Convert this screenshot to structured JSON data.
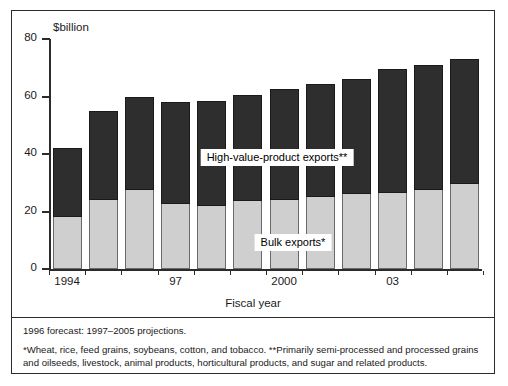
{
  "chart_data": {
    "type": "bar",
    "subtype": "stacked",
    "title": "",
    "xlabel": "Fiscal year",
    "ylabel": "$billion",
    "units_label": "$billion",
    "ylim": [
      0,
      80
    ],
    "yticks": [
      0,
      20,
      40,
      60,
      80
    ],
    "ytick_labels": [
      "0",
      "20",
      "40",
      "60",
      "80"
    ],
    "grid": false,
    "legend_position": "inside-plot",
    "categories": [
      1994,
      1995,
      1996,
      1997,
      1998,
      1999,
      2000,
      2001,
      2002,
      2003,
      2004,
      2005
    ],
    "xtick_labels": [
      {
        "value": 1994,
        "label": "1994"
      },
      {
        "value": 1997,
        "label": "97"
      },
      {
        "value": 2000,
        "label": "2000"
      },
      {
        "value": 2003,
        "label": "03"
      }
    ],
    "series": [
      {
        "name": "Bulk exports*",
        "color": "#cfcfcf",
        "values": [
          18.0,
          24.0,
          27.5,
          22.5,
          22.0,
          23.5,
          24.0,
          25.0,
          26.0,
          26.5,
          27.5,
          29.5
        ]
      },
      {
        "name": "High-value-product exports**",
        "color": "#2e2e2e",
        "values": [
          24.0,
          31.0,
          32.5,
          35.5,
          36.5,
          37.0,
          38.5,
          39.5,
          40.0,
          43.0,
          43.5,
          43.5
        ]
      }
    ],
    "totals": [
      42.0,
      55.0,
      60.0,
      58.0,
      58.5,
      60.5,
      62.5,
      64.5,
      66.0,
      69.5,
      71.0,
      73.0
    ],
    "annotations": [
      {
        "name": "legend-hvp",
        "text": "High-value-product exports**"
      },
      {
        "name": "legend-bulk",
        "text": "Bulk exports*"
      }
    ]
  },
  "footnotes": {
    "forecast": "1996 forecast: 1997–2005 projections.",
    "sources": "*Wheat, rice, feed grains, soybeans, cotton, and tobacco.  **Primarily semi-processed and processed grains and oilseeds, livestock, animal products, horticultural products, and sugar and related products."
  }
}
